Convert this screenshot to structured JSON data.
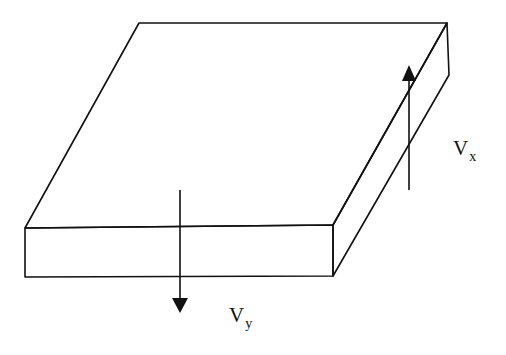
{
  "diagram": {
    "title": "",
    "labels": {
      "vx": {
        "main": "V",
        "sub": "x"
      },
      "vy": {
        "main": "V",
        "sub": "y"
      }
    },
    "colors": {
      "stroke": "#111111",
      "background": "#ffffff"
    }
  }
}
